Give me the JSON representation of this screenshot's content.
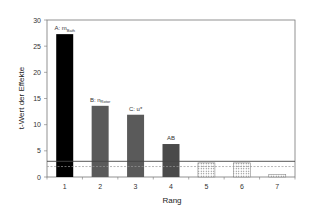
{
  "chart_data": {
    "type": "bar",
    "title": "",
    "xlabel": "Rang",
    "ylabel": "t-Wert der Effekte",
    "ylim": [
      0,
      30
    ],
    "yticks": [
      0,
      5,
      10,
      15,
      20,
      25,
      30
    ],
    "categories": [
      "1",
      "2",
      "3",
      "4",
      "5",
      "6",
      "7"
    ],
    "values": [
      27.3,
      13.6,
      11.9,
      6.3,
      2.7,
      2.7,
      0.5
    ],
    "bar_fills": [
      "solid-black",
      "solid-gray",
      "solid-gray",
      "solid-darkgray",
      "dotted",
      "dotted",
      "dotted"
    ],
    "annotations": [
      {
        "bar": 1,
        "text": "A: m",
        "sub": "Bath"
      },
      {
        "bar": 2,
        "text": "B: n",
        "sub": "Rotor"
      },
      {
        "bar": 3,
        "text": "C: u*",
        "sub": ""
      },
      {
        "bar": 4,
        "text": "AB",
        "sub": ""
      }
    ],
    "reference_lines": [
      {
        "value": 3.0,
        "style": "solid"
      },
      {
        "value": 2.0,
        "style": "dashed"
      }
    ],
    "grid": false,
    "legend": null
  },
  "colors": {
    "bar_black": "#000000",
    "bar_gray": "#5a5a5a",
    "bar_darkgray": "#4a4a4a",
    "axis": "#555555"
  }
}
